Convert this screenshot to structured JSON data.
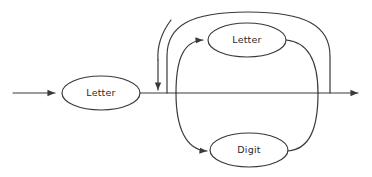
{
  "diagram": {
    "type": "railroad-syntax-diagram",
    "background_color": "#ffffff",
    "line_color": "#3a3a3a",
    "text_color": "#2b2b2b",
    "nodes": [
      {
        "id": "letter-first",
        "label": "Letter",
        "cx": 101,
        "cy": 93,
        "rx": 39,
        "ry": 17
      },
      {
        "id": "letter-loop",
        "label": "Letter",
        "cx": 247,
        "cy": 40,
        "rx": 39,
        "ry": 17
      },
      {
        "id": "digit-loop",
        "label": "Digit",
        "cx": 249,
        "cy": 150,
        "rx": 39,
        "ry": 17
      }
    ],
    "entry_arrow": {
      "x1": 13,
      "x2": 57,
      "y": 93
    },
    "exit_arrow": {
      "x1": 330,
      "x2": 362,
      "y": 93
    },
    "junction_x": 167,
    "merge_x": 330,
    "main_line_y": 93
  }
}
